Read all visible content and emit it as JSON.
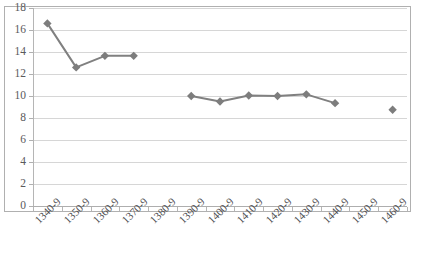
{
  "clipped_header_fragment": "",
  "chart_data": {
    "type": "line",
    "title": "",
    "subtitle": "",
    "xlabel": "",
    "ylabel": "",
    "categories": [
      "1340-9",
      "1350-9",
      "1360-9",
      "1370-9",
      "1380-9",
      "1390-9",
      "1400-9",
      "1410-9",
      "1420-9",
      "1430-9",
      "1440-9",
      "1450-9",
      "1460-9"
    ],
    "series": [
      {
        "name": "",
        "values": [
          16.6,
          12.6,
          13.65,
          13.65,
          null,
          10.0,
          9.5,
          10.05,
          10.0,
          10.15,
          9.35,
          null,
          8.75
        ]
      }
    ],
    "ylim": [
      0,
      18
    ],
    "ytick_step": 2,
    "ytick_labels": [
      "0",
      "2",
      "4",
      "6",
      "8",
      "10",
      "12",
      "14",
      "16",
      "18"
    ],
    "grid": true,
    "legend": "none",
    "marker": "diamond",
    "gaps_at": [
      "1380-9",
      "1450-9"
    ],
    "colors": {
      "series_line": "#808080",
      "marker": "#7d7d7d",
      "gridline": "#d6d6d6",
      "axis": "#b0b0b0",
      "tick_text": "#59595b",
      "plot_background": "#ffffff",
      "plot_border": "#b0b0b0"
    }
  }
}
